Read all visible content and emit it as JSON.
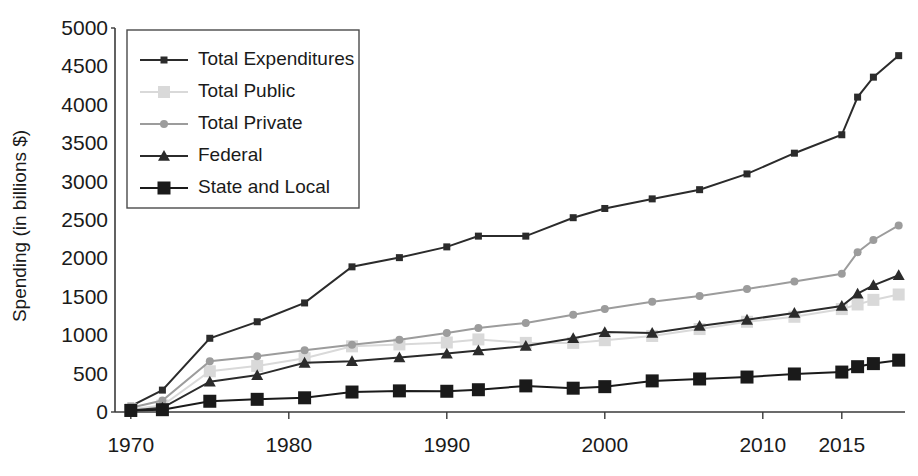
{
  "chart_data": {
    "type": "line",
    "title": "",
    "xlabel": "",
    "ylabel": "Spending (in billions $)",
    "ylim": [
      0,
      5000
    ],
    "ytick_values": [
      0,
      500,
      1000,
      1500,
      2000,
      2500,
      3000,
      3500,
      4000,
      4500,
      5000
    ],
    "ytick_labels": [
      "0",
      "500",
      "1000",
      "1500",
      "2000",
      "2500",
      "3000",
      "3500",
      "4000",
      "4500",
      "5000"
    ],
    "xtick_values": [
      1970,
      1980,
      1990,
      2000,
      2010,
      2015
    ],
    "xtick_labels": [
      "1970",
      "1980",
      "1990",
      "2000",
      "2010",
      "2015"
    ],
    "xlim": [
      1969,
      2019
    ],
    "grid": false,
    "legend_position": "upper-left-inset",
    "x": [
      1970,
      1972,
      1975,
      1978,
      1981,
      1984,
      1987,
      1990,
      1992,
      1995,
      1998,
      2000,
      2003,
      2006,
      2009,
      2012,
      2015,
      2018
    ],
    "series": [
      {
        "name": "Total Expenditures",
        "color": "#2b2b2b",
        "marker": "square-small",
        "values": [
          75,
          285,
          960,
          1175,
          1420,
          1890,
          2010,
          2150,
          2290,
          2290,
          2530,
          2650,
          2775,
          2895,
          3100,
          3370,
          3610,
          3860
        ]
      },
      {
        "name": "Total Public",
        "color": "#d9d9d9",
        "marker": "square-large",
        "values": [
          35,
          85,
          530,
          600,
          700,
          855,
          880,
          905,
          945,
          900,
          900,
          935,
          990,
          1080,
          1175,
          1240,
          1340,
          1430
        ]
      },
      {
        "name": "Total Private",
        "color": "#9c9c9c",
        "marker": "circle",
        "values": [
          55,
          150,
          660,
          725,
          805,
          875,
          940,
          1030,
          1095,
          1160,
          1265,
          1340,
          1435,
          1510,
          1600,
          1700,
          1800,
          1900
        ]
      },
      {
        "name": "Federal",
        "color": "#2b2b2b",
        "marker": "triangle",
        "values": [
          18,
          55,
          395,
          480,
          640,
          660,
          710,
          760,
          800,
          860,
          960,
          1040,
          1030,
          1120,
          1200,
          1290,
          1380,
          1465
        ]
      },
      {
        "name": "State and Local",
        "color": "#1a1a1a",
        "marker": "square-big",
        "values": [
          20,
          30,
          140,
          165,
          185,
          260,
          275,
          270,
          290,
          340,
          310,
          330,
          405,
          430,
          455,
          495,
          520,
          545
        ]
      }
    ],
    "series_tail": {
      "note": "final-segment values continue to chart right edge",
      "Total Expenditures": [
        4100,
        4360,
        4640
      ],
      "Total Public": [
        1400,
        1460,
        1530
      ],
      "Total Private": [
        2080,
        2240,
        2430
      ],
      "Federal": [
        1540,
        1650,
        1780
      ],
      "State and Local": [
        590,
        630,
        675
      ]
    }
  },
  "legend": {
    "entries": [
      {
        "label": "Total Expenditures"
      },
      {
        "label": "Total Public"
      },
      {
        "label": "Total Private"
      },
      {
        "label": "Federal"
      },
      {
        "label": "State and Local"
      }
    ]
  },
  "axes": {
    "y_title": "Spending (in billions $)"
  },
  "colors": {
    "total_expenditures": "#2b2b2b",
    "total_public": "#d9d9d9",
    "total_private": "#9c9c9c",
    "federal": "#2b2b2b",
    "state_and_local": "#1a1a1a",
    "axis": "#3a3a3a",
    "text": "#1a1a1a",
    "background": "#ffffff"
  }
}
